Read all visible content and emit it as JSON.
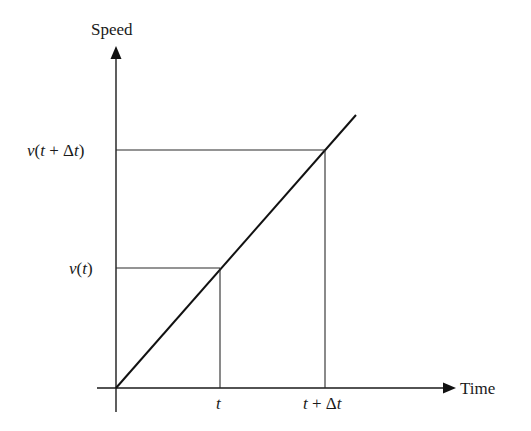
{
  "diagram": {
    "y_axis": {
      "label": "Speed"
    },
    "x_axis": {
      "label": "Time"
    },
    "x_ticks": [
      {
        "label": "t"
      },
      {
        "label_var": "t",
        "label_op": " + ",
        "label_delta": "Δ",
        "label_var2": "t"
      }
    ],
    "y_ticks": [
      {
        "fn": "v",
        "open": "(",
        "arg": "t",
        "close": ")"
      },
      {
        "fn": "v",
        "open": "(",
        "arg": "t",
        "op": " + ",
        "delta": "Δ",
        "arg2": "t",
        "close": ")"
      }
    ],
    "colors": {
      "line": "#111111",
      "background": "#ffffff"
    }
  }
}
